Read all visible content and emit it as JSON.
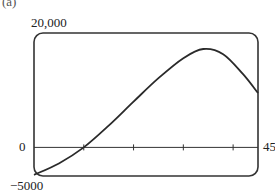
{
  "figure": {
    "part_label": "(a)"
  },
  "chart_data": {
    "type": "line",
    "title": "",
    "xlabel": "",
    "ylabel": "",
    "xlim": [
      0,
      45
    ],
    "ylim": [
      -5000,
      20000
    ],
    "grid": false,
    "axis_labels": {
      "y_top": "20,000",
      "y_zero": "0",
      "y_bottom": "−5000",
      "x_right": "45"
    },
    "x_ticks": [
      10,
      20,
      30,
      40
    ],
    "series": [
      {
        "name": "curve",
        "x": [
          0,
          5,
          10,
          15,
          20,
          25,
          30,
          34,
          38,
          42,
          45
        ],
        "y": [
          -4800,
          -2800,
          0,
          3800,
          8000,
          12100,
          15600,
          17200,
          16300,
          12800,
          9500
        ]
      }
    ]
  }
}
